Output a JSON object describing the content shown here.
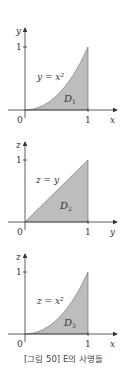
{
  "panels": [
    {
      "vertical_axis": "y",
      "horizontal_axis": "x",
      "curve_label": "y = x²",
      "region_label": "D",
      "region_sub": "1",
      "origin_label": "0",
      "tick_v": "1",
      "tick_h": "1",
      "shape": "parabola"
    },
    {
      "vertical_axis": "z",
      "horizontal_axis": "y",
      "curve_label": "z = y",
      "region_label": "D",
      "region_sub": "2",
      "origin_label": "0",
      "tick_v": "1",
      "tick_h": "1",
      "shape": "triangle"
    },
    {
      "vertical_axis": "z",
      "horizontal_axis": "x",
      "curve_label": "z = x²",
      "region_label": "D",
      "region_sub": "3",
      "origin_label": "0",
      "tick_v": "1",
      "tick_h": "1",
      "shape": "parabola"
    }
  ],
  "caption": "[그림 50] E의 사영들",
  "colors": {
    "fill": "#bdbdbd",
    "axis": "#333333",
    "stroke": "#555555"
  }
}
